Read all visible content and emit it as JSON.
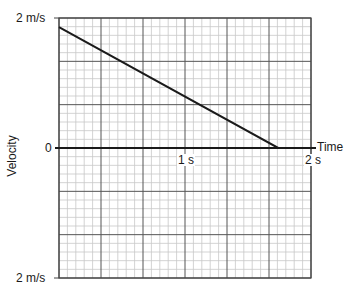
{
  "chart_data": {
    "type": "line",
    "title": "",
    "xlabel": "Time",
    "ylabel": "Velocity",
    "x_unit": "s",
    "y_unit": "m/s",
    "xlim": [
      0,
      2
    ],
    "ylim": [
      -2,
      2
    ],
    "x_ticks": [
      {
        "value": 1,
        "label": "1 s"
      },
      {
        "value": 2,
        "label": "2 s"
      }
    ],
    "y_ticks": [
      {
        "value": 2,
        "label": "2 m/s"
      },
      {
        "value": 0,
        "label": "0"
      },
      {
        "value": -2,
        "label": "2 m/s"
      }
    ],
    "grid": true,
    "grid_major_x_step": 0.3333,
    "grid_major_y_step": 0.6667,
    "grid_minor_per_major": 5,
    "series": [
      {
        "name": "velocity",
        "color": "#1a1a1a",
        "x": [
          0,
          1.74,
          2.0
        ],
        "y": [
          1.86,
          0,
          0
        ]
      }
    ],
    "legend": null
  },
  "labels": {
    "y_top": "2 m/s",
    "y_zero": "0",
    "y_bottom": "2 m/s",
    "x_one": "1 s",
    "x_two": "2 s",
    "x_axis_title": "Time",
    "y_axis_title": "Velocity"
  }
}
